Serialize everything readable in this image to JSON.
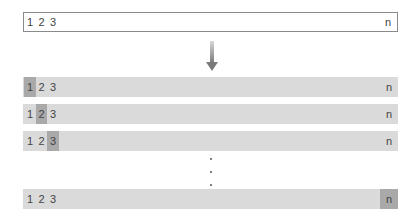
{
  "diagram": {
    "type": "sequential-scan-illustration",
    "input_array": {
      "cells": [
        "1",
        "2",
        "3",
        "n"
      ]
    },
    "arrow": {
      "direction": "down",
      "color": "#8c8c8c"
    },
    "steps": [
      {
        "cells": [
          "1",
          "2",
          "3",
          "n"
        ],
        "highlighted_index": 0
      },
      {
        "cells": [
          "1",
          "2",
          "3",
          "n"
        ],
        "highlighted_index": 1
      },
      {
        "cells": [
          "1",
          "2",
          "3",
          "n"
        ],
        "highlighted_index": 2
      },
      {
        "cells": [
          "1",
          "2",
          "3",
          "n"
        ],
        "highlighted_index": 3
      }
    ],
    "ellipsis": "vertical-dots",
    "colors": {
      "row_background": "#dadada",
      "highlight": "#a9a9a9",
      "box_border": "#8a8a8a",
      "text": "#444444"
    }
  }
}
